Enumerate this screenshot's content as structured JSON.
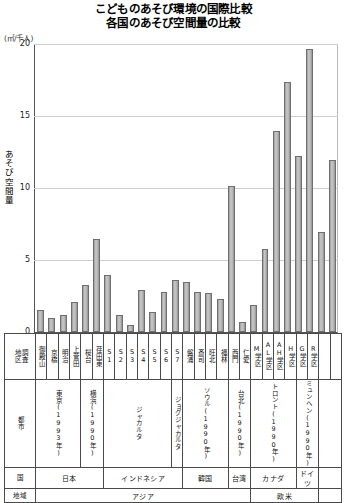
{
  "title": {
    "line1": "こどものあそび環境の国際比較",
    "line2": "各国のあそび空間量の比較"
  },
  "axis": {
    "unit": "(㎡/千人)",
    "y_title": "あそび空間量",
    "y_ticks": [
      "20",
      "15",
      "10",
      "5",
      "0"
    ]
  },
  "table": {
    "row_labels": {
      "district": "地区調査",
      "district_a": "地区",
      "district_b": "調査",
      "city": "都市",
      "country": "国",
      "region": "地域"
    },
    "districts": [
      "御殿山",
      "京橋",
      "明治",
      "上菅田",
      "桜台",
      "荏田東",
      "S1",
      "S2",
      "S3",
      "S4",
      "S5",
      "S6",
      "S7",
      "盤浦",
      "斎司",
      "旺北",
      "福林",
      "西門",
      "仁愛",
      "M学区",
      "AL学区",
      "AH学区",
      "H学区",
      "G学区",
      "R学区"
    ],
    "cities": [
      {
        "label": "東京(1993年)",
        "span": 4
      },
      {
        "label": "横浜(1990年)",
        "span": 2
      },
      {
        "label": "ジャカルタ",
        "span": 6
      },
      {
        "label": "ジョグジャカルタ",
        "span": 1
      },
      {
        "label": "ソウル(1990年)",
        "span": 4
      },
      {
        "label": "台北(1990年)",
        "span": 2
      },
      {
        "label": "トロント(1990年)",
        "span": 4
      },
      {
        "label": "ミュンヘン(1990年)",
        "span": 2
      }
    ],
    "countries": [
      {
        "label": "日本",
        "span": 6
      },
      {
        "label": "インドネシア",
        "span": 7
      },
      {
        "label": "韓国",
        "span": 4
      },
      {
        "label": "台湾",
        "span": 2
      },
      {
        "label": "カナダ",
        "span": 4
      },
      {
        "label": "ドイツ",
        "span": 2
      }
    ],
    "regions": [
      {
        "label": "アジア",
        "span": 19
      },
      {
        "label": "欧米",
        "span": 6
      }
    ]
  },
  "chart_data": {
    "type": "bar",
    "xlabel": "",
    "ylabel": "あそび空間量 (㎡/千人)",
    "ylim": [
      0,
      20
    ],
    "yticks": [
      0,
      5,
      10,
      15,
      20
    ],
    "grid": true,
    "legend": "none",
    "bar_color": "#b4b4b4",
    "categories": [
      "御殿山",
      "京橋",
      "明治",
      "上菅田",
      "桜台",
      "荏田東",
      "S1",
      "S2",
      "S3",
      "S4",
      "S5",
      "S6",
      "S7",
      "盤浦",
      "斎司",
      "旺北",
      "福林",
      "西門",
      "仁愛",
      "M学区",
      "AL学区",
      "AH学区",
      "H学区",
      "G学区",
      "R学区"
    ],
    "values": [
      1.5,
      1.0,
      1.2,
      2.1,
      3.3,
      6.5,
      4.0,
      1.2,
      0.5,
      2.9,
      1.4,
      2.8,
      3.6,
      3.5,
      2.8,
      2.7,
      2.3,
      10.2,
      0.7,
      1.9,
      5.8,
      14.0,
      17.4,
      12.3,
      19.7
    ],
    "extra_values": [
      7.0,
      12.0
    ],
    "all_values": [
      1.5,
      1.0,
      1.2,
      2.1,
      3.3,
      6.5,
      4.0,
      1.2,
      0.5,
      2.9,
      1.4,
      2.8,
      3.6,
      3.5,
      2.8,
      2.7,
      2.3,
      10.2,
      0.7,
      1.9,
      5.8,
      14.0,
      17.4,
      12.3,
      19.7,
      7.0,
      12.0
    ]
  }
}
